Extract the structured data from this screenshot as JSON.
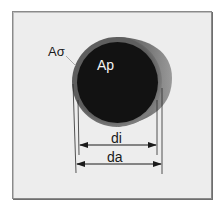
{
  "diagram": {
    "type": "pipe-cross-section",
    "labels": {
      "wall_area": "Aσ",
      "inner_area": "Ap",
      "inner_diameter": "di",
      "outer_diameter": "da"
    },
    "colors": {
      "background": "#ededed",
      "frame_border": "#8a8a8a",
      "pipe_wall": "#6b6b6b",
      "pipe_wall_highlight": "#8c8c8c",
      "pipe_interior": "#121212",
      "label_light": "#f2f2f2",
      "label_dark": "#1a1a1a",
      "dimension_line": "#1a1a1a"
    }
  }
}
